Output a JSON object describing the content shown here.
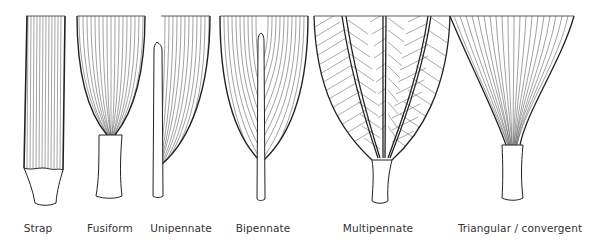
{
  "diagram": {
    "colors": {
      "ink": "#2a2a2a",
      "fiber": "#555555",
      "background": "#ffffff"
    },
    "shapes": [
      {
        "id": "strap",
        "label": "Strap",
        "label_x": 38
      },
      {
        "id": "fusiform",
        "label": "Fusiform",
        "label_x": 110
      },
      {
        "id": "unipennate",
        "label": "Unipennate",
        "label_x": 181
      },
      {
        "id": "bipennate",
        "label": "Bipennate",
        "label_x": 263
      },
      {
        "id": "multipennate",
        "label": "Multipennate",
        "label_x": 378
      },
      {
        "id": "triangular",
        "label": "Triangular / convergent",
        "label_x": 520
      }
    ]
  }
}
